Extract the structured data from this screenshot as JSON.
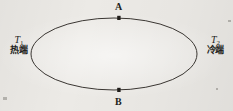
{
  "figure": {
    "type": "thermocouple-loop-diagram",
    "background_color": "#eceae6",
    "line_color": "#3a3632",
    "text_color": "#231f1c",
    "loop": {
      "shape": "ellipse",
      "center_x": 114,
      "center_y": 54,
      "radius_x": 83,
      "radius_y": 36,
      "stroke_width": 1
    },
    "junctions": [
      {
        "id": "A",
        "label": "A",
        "position": "top",
        "x": 119,
        "y": 18,
        "marker": "filled-square-dot"
      },
      {
        "id": "B",
        "label": "B",
        "position": "bottom",
        "x": 119,
        "y": 90,
        "marker": "filled-square-dot"
      }
    ],
    "terminals": [
      {
        "id": "hot",
        "symbol": "T",
        "subscript": "1",
        "name": "热端",
        "side": "left"
      },
      {
        "id": "cold",
        "symbol": "T",
        "subscript": "2",
        "name": "冷端",
        "side": "right"
      }
    ]
  }
}
